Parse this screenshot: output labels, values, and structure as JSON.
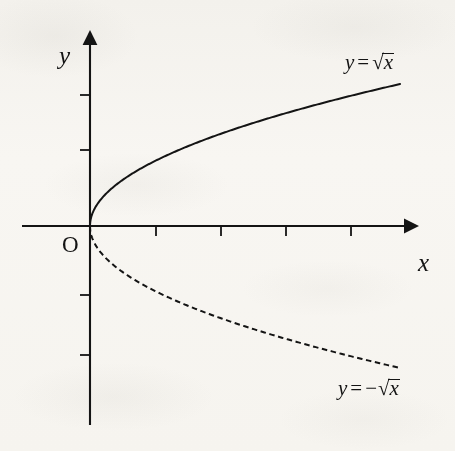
{
  "figure": {
    "kind": "cartesian-plot",
    "origin_label": "O",
    "x_axis_label": "x",
    "y_axis_label": "y",
    "ink_color": "#141414",
    "paper_color": "#fbfaf8"
  },
  "labels": {
    "sqrt_curve": {
      "lhs": "y",
      "equals": "=",
      "sign": "",
      "radical_sign": "√",
      "radicand": "x",
      "full_text": "y = √x"
    },
    "neg_sqrt_curve": {
      "lhs": "y",
      "equals": "=",
      "sign": "−",
      "radical_sign": "√",
      "radicand": "x",
      "full_text": "y = −√x"
    }
  },
  "chart_data": {
    "type": "line",
    "title": "",
    "subtitle": "",
    "xlabel": "x",
    "ylabel": "y",
    "grid": false,
    "legend_position": "inline-curve-end",
    "axes": {
      "origin_px": [
        90,
        226
      ],
      "x_unit_px": 65,
      "y_unit_px": 65,
      "x_axis_span_px": [
        22,
        416
      ],
      "y_axis_span_px": [
        34,
        425
      ],
      "x_tick_positions_px": [
        156,
        221,
        286,
        351
      ],
      "y_tick_positions_px": [
        95,
        150,
        295,
        355
      ],
      "x_tick_values": [
        1,
        2,
        3,
        4
      ],
      "y_tick_values": [
        2,
        1.17,
        -1.06,
        -1.98
      ],
      "tick_labels_shown": false,
      "arrowheads": [
        "x-positive",
        "y-positive"
      ]
    },
    "xlim": [
      -1.05,
      5.0
    ],
    "ylim": [
      -3.06,
      2.95
    ],
    "series": [
      {
        "name": "y = √x",
        "style": "solid",
        "color": "#141414",
        "x": [
          0,
          0.05,
          0.1,
          0.2,
          0.3,
          0.5,
          0.75,
          1.0,
          1.5,
          2.0,
          2.5,
          3.0,
          3.5,
          4.0,
          4.5,
          4.77
        ],
        "y": [
          0,
          0.224,
          0.316,
          0.447,
          0.548,
          0.707,
          0.866,
          1.0,
          1.225,
          1.414,
          1.581,
          1.732,
          1.871,
          2.0,
          2.121,
          2.184
        ]
      },
      {
        "name": "y = −√x",
        "style": "dashed",
        "color": "#141414",
        "x": [
          0,
          0.05,
          0.1,
          0.2,
          0.3,
          0.5,
          0.75,
          1.0,
          1.5,
          2.0,
          2.5,
          3.0,
          3.5,
          4.0,
          4.5,
          4.77
        ],
        "y": [
          0,
          -0.224,
          -0.316,
          -0.447,
          -0.548,
          -0.707,
          -0.866,
          -1.0,
          -1.225,
          -1.414,
          -1.581,
          -1.732,
          -1.871,
          -2.0,
          -2.121,
          -2.184
        ]
      }
    ],
    "annotations": [
      {
        "text": "O",
        "x": -0.38,
        "y": -0.37,
        "role": "origin-marker"
      },
      {
        "text": "y = √x",
        "x": 4.72,
        "y": 2.72,
        "role": "curve-label"
      },
      {
        "text": "y = −√x",
        "x": 4.55,
        "y": -2.53,
        "role": "curve-label"
      },
      {
        "text": "x",
        "x": 5.06,
        "y": -0.56,
        "role": "axis-name"
      },
      {
        "text": "y",
        "x": -0.53,
        "y": 2.6,
        "role": "axis-name"
      }
    ]
  }
}
